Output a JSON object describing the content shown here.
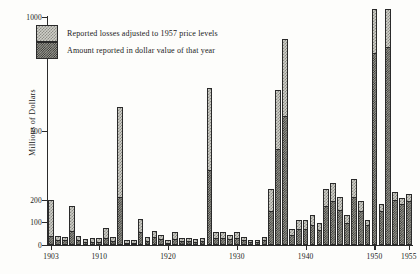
{
  "chart_data": {
    "type": "bar",
    "title": "",
    "subtitle": "",
    "xlabel": "",
    "ylabel": "Millions of Dollars",
    "grid": false,
    "legend_position": "top-left",
    "stacked": true,
    "xlim": [
      1902.4,
      1955.6
    ],
    "ylim": [
      0,
      1050
    ],
    "ytick_values": [
      0,
      100,
      200,
      500,
      1000
    ],
    "ytick_labels": [
      "0",
      "100",
      "200",
      "500",
      "1000"
    ],
    "xtick_values": [
      1903,
      1910,
      1920,
      1930,
      1940,
      1950,
      1955
    ],
    "xtick_labels": [
      "1903",
      "1910",
      "1920",
      "1930",
      "1940",
      "1950",
      "1955"
    ],
    "categories": [
      1903,
      1904,
      1905,
      1906,
      1907,
      1908,
      1909,
      1910,
      1911,
      1912,
      1913,
      1914,
      1915,
      1916,
      1917,
      1918,
      1919,
      1920,
      1921,
      1922,
      1923,
      1924,
      1925,
      1926,
      1927,
      1928,
      1929,
      1930,
      1931,
      1932,
      1933,
      1934,
      1935,
      1936,
      1937,
      1938,
      1939,
      1940,
      1941,
      1942,
      1943,
      1944,
      1945,
      1946,
      1947,
      1948,
      1949,
      1950,
      1951,
      1952,
      1953,
      1954,
      1955
    ],
    "series": [
      {
        "name": "Reported losses adjusted to 1957 price levels",
        "key": "adjusted",
        "values": [
          200,
          40,
          35,
          175,
          40,
          28,
          30,
          30,
          75,
          35,
          605,
          22,
          20,
          115,
          35,
          60,
          45,
          20,
          55,
          30,
          30,
          25,
          30,
          690,
          55,
          55,
          45,
          55,
          35,
          20,
          20,
          35,
          250,
          680,
          905,
          70,
          110,
          110,
          130,
          95,
          250,
          275,
          215,
          130,
          290,
          195,
          110,
          1035,
          180,
          1035,
          235,
          210,
          225
        ]
      },
      {
        "name": "Amount reported in dollar value of that year",
        "key": "nominal",
        "values": [
          40,
          20,
          20,
          60,
          20,
          12,
          14,
          14,
          32,
          16,
          215,
          10,
          10,
          55,
          18,
          35,
          28,
          10,
          28,
          16,
          16,
          14,
          16,
          330,
          30,
          30,
          26,
          30,
          20,
          12,
          12,
          20,
          150,
          420,
          565,
          45,
          70,
          70,
          85,
          65,
          175,
          195,
          155,
          95,
          215,
          150,
          88,
          840,
          150,
          870,
          200,
          180,
          195
        ]
      }
    ],
    "legend": [
      "Reported losses adjusted to 1957 price levels",
      "Amount reported in dollar value of that year"
    ],
    "colors": {
      "adjusted_fill": "#cfcfc9",
      "adjusted_hatch": "#8d8d86",
      "nominal_fill": "#9a9a92",
      "nominal_hatch": "#2f2f2c",
      "axis": "#2b2b2b",
      "background": "#fdfdfb"
    }
  }
}
